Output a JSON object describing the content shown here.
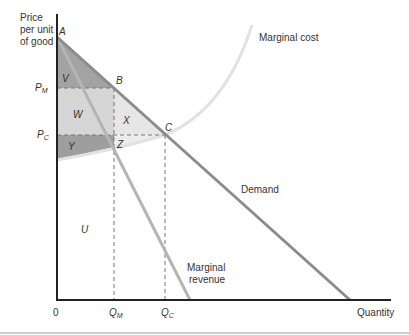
{
  "diagram": {
    "type": "monopoly deadweight loss diagram",
    "y_axis_label": [
      "Price",
      "per unit",
      "of good"
    ],
    "x_axis_label": "Quantity",
    "origin_label": "0",
    "curves": {
      "demand": "Demand",
      "marginal_cost": "Marginal cost",
      "marginal_revenue": [
        "Marginal",
        "revenue"
      ]
    },
    "points": {
      "A": "A",
      "B": "B",
      "C": "C",
      "Z": "Z"
    },
    "price_ticks": {
      "pm": "P",
      "pm_sub": "M",
      "pc": "P",
      "pc_sub": "C"
    },
    "quantity_ticks": {
      "qm": "Q",
      "qm_sub": "M",
      "qc": "Q",
      "qc_sub": "C"
    },
    "regions": {
      "V": "V",
      "W": "W",
      "X": "X",
      "Y": "Y",
      "U": "U"
    },
    "colors": {
      "axis": "#222222",
      "demand_line": "#8a8a8a",
      "mr_line": "#b5b5b5",
      "mc_curve": "#e3e3e3",
      "region_dark": "#9a9a9a",
      "region_light": "#d9d9d9",
      "region_lighter": "#e8e8e8",
      "dashed": "#777777"
    }
  }
}
